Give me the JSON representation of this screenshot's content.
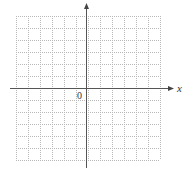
{
  "diagram": {
    "type": "coordinate-grid",
    "grid": {
      "columns": 12,
      "rows": 12,
      "left": 16,
      "top": 16,
      "cell": 12,
      "line_style": "dotted",
      "line_color": "#b8b8b8"
    },
    "axes": {
      "color": "#555555",
      "x_axis": {
        "y": 88,
        "from": 10,
        "to": 174,
        "label": "x"
      },
      "y_axis": {
        "x": 86,
        "from": 168,
        "to": 3
      },
      "origin_label": "0"
    }
  }
}
